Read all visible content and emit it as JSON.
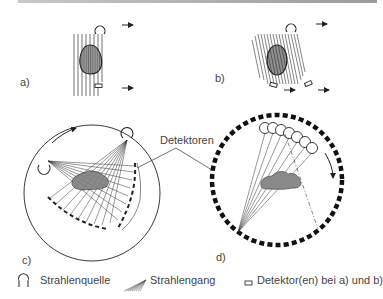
{
  "panels": {
    "a": {
      "label": "a)"
    },
    "b": {
      "label": "b)"
    },
    "c": {
      "label": "c)"
    },
    "d": {
      "label": "d)"
    }
  },
  "annotation": {
    "detectors": "Detektoren"
  },
  "legend": {
    "items": [
      {
        "icon": "x-ray-source-icon",
        "label": "Strahlenquelle"
      },
      {
        "icon": "beam-path-icon",
        "label": "Strahlengang"
      },
      {
        "icon": "detector-icon",
        "label": "Detektor(en) bei a) und b)"
      }
    ]
  },
  "colors": {
    "line": "#222222",
    "object_fill": "#8a8a8a",
    "text": "#444444",
    "top_rule": "#a0a0a0"
  }
}
